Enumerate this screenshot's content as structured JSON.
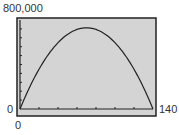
{
  "chart_data": {
    "type": "line",
    "title": "",
    "xlabel": "",
    "ylabel": "",
    "xlim": [
      0,
      140
    ],
    "ylim": [
      0,
      800000
    ],
    "x_tick_interval": 20,
    "y_tick_interval": 80000,
    "grid": false,
    "legend": null,
    "tick_labels": {
      "y_max": "800,000",
      "y_min": "0",
      "x_min": "0",
      "x_max": "140"
    },
    "series": [
      {
        "name": "curve",
        "x": [
          0,
          10,
          20,
          30,
          40,
          50,
          60,
          70,
          80,
          90,
          100,
          110,
          120,
          130,
          140
        ],
        "y": [
          0,
          139000,
          258000,
          357000,
          437000,
          497000,
          536000,
          556000,
          556000,
          536000,
          497000,
          437000,
          357000,
          258000,
          0
        ],
        "note": "downward parabola, max ≈ 730,000 near x ≈ 70"
      }
    ],
    "colors": {
      "plot_background": "#d4d4d4",
      "frame": "#222222",
      "curve": "#222222"
    }
  }
}
